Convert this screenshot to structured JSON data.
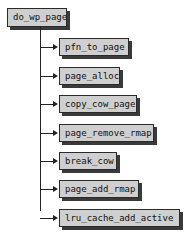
{
  "root": {
    "label": "do_wp_page"
  },
  "children": [
    {
      "label": "pfn_to_page"
    },
    {
      "label": "page_alloc"
    },
    {
      "label": "copy_cow_page"
    },
    {
      "label": "page_remove_rmap"
    },
    {
      "label": "break_cow"
    },
    {
      "label": "page_add_rmap"
    },
    {
      "label": "lru_cache_add_active"
    }
  ]
}
